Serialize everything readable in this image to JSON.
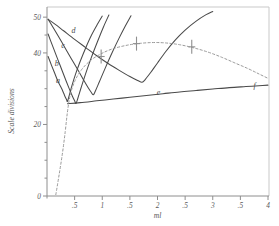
{
  "chart_data": {
    "type": "line",
    "title": "",
    "xlabel": "ml",
    "ylabel": "Scale divisions",
    "xlim": [
      0,
      4
    ],
    "ylim": [
      0,
      52
    ],
    "grid": false,
    "legend": "inline-curve-labels",
    "x_ticks": [
      {
        "value": 0,
        "label": ""
      },
      {
        "value": 0.5,
        "label": ".5"
      },
      {
        "value": 1.0,
        "label": "1"
      },
      {
        "value": 1.5,
        "label": ".5"
      },
      {
        "value": 2.0,
        "label": "2"
      },
      {
        "value": 2.5,
        "label": ".5"
      },
      {
        "value": 3.0,
        "label": "3"
      },
      {
        "value": 3.5,
        "label": ".5"
      },
      {
        "value": 4.0,
        "label": "4"
      }
    ],
    "y_ticks": [
      {
        "value": 0,
        "label": "0"
      },
      {
        "value": 5,
        "label": ""
      },
      {
        "value": 10,
        "label": ""
      },
      {
        "value": 15,
        "label": ""
      },
      {
        "value": 20,
        "label": "20"
      },
      {
        "value": 25,
        "label": ""
      },
      {
        "value": 30,
        "label": ""
      },
      {
        "value": 35,
        "label": ""
      },
      {
        "value": 40,
        "label": "40"
      },
      {
        "value": 45,
        "label": ""
      },
      {
        "value": 50,
        "label": "50"
      }
    ],
    "series": [
      {
        "name": "a",
        "label": "a",
        "style": "solid",
        "label_x": 0.2,
        "label_y": 31.5,
        "points": [
          [
            0.02,
            39.0
          ],
          [
            0.08,
            36.6
          ],
          [
            0.14,
            34.3
          ],
          [
            0.2,
            32.0
          ],
          [
            0.26,
            30.2
          ],
          [
            0.3,
            28.8
          ],
          [
            0.33,
            27.7
          ],
          [
            0.355,
            26.9
          ],
          [
            0.37,
            26.4
          ],
          [
            0.4,
            28.0
          ],
          [
            0.45,
            30.8
          ],
          [
            0.52,
            34.2
          ],
          [
            0.6,
            37.6
          ],
          [
            0.7,
            41.4
          ],
          [
            0.8,
            44.8
          ],
          [
            0.92,
            48.2
          ],
          [
            1.0,
            50.3
          ]
        ]
      },
      {
        "name": "b",
        "label": "b",
        "style": "solid",
        "label_x": 0.175,
        "label_y": 36.4,
        "points": [
          [
            0.02,
            45.3
          ],
          [
            0.08,
            42.8
          ],
          [
            0.16,
            39.6
          ],
          [
            0.24,
            36.4
          ],
          [
            0.32,
            33.2
          ],
          [
            0.4,
            30.1
          ],
          [
            0.46,
            27.9
          ],
          [
            0.5,
            26.6
          ],
          [
            0.525,
            25.9
          ],
          [
            0.56,
            27.4
          ],
          [
            0.62,
            30.4
          ],
          [
            0.7,
            34.2
          ],
          [
            0.8,
            38.6
          ],
          [
            0.92,
            43.4
          ],
          [
            1.02,
            47.2
          ],
          [
            1.12,
            50.6
          ]
        ]
      },
      {
        "name": "c",
        "label": "c",
        "style": "solid",
        "label_x": 0.29,
        "label_y": 41.3,
        "points": [
          [
            0.02,
            49.4
          ],
          [
            0.1,
            47.4
          ],
          [
            0.2,
            44.8
          ],
          [
            0.32,
            41.6
          ],
          [
            0.44,
            38.4
          ],
          [
            0.56,
            35.2
          ],
          [
            0.66,
            32.5
          ],
          [
            0.74,
            30.4
          ],
          [
            0.8,
            29.0
          ],
          [
            0.84,
            28.3
          ],
          [
            0.88,
            29.5
          ],
          [
            0.95,
            32.0
          ],
          [
            1.05,
            35.6
          ],
          [
            1.18,
            40.1
          ],
          [
            1.3,
            44.0
          ],
          [
            1.42,
            47.6
          ],
          [
            1.52,
            50.4
          ]
        ]
      },
      {
        "name": "d",
        "label": "d",
        "style": "solid",
        "label_x": 0.48,
        "label_y": 45.6,
        "points": [
          [
            0.02,
            49.4
          ],
          [
            0.15,
            48.0
          ],
          [
            0.3,
            46.2
          ],
          [
            0.5,
            43.8
          ],
          [
            0.7,
            41.5
          ],
          [
            0.9,
            39.2
          ],
          [
            1.1,
            37.1
          ],
          [
            1.3,
            35.2
          ],
          [
            1.5,
            33.4
          ],
          [
            1.64,
            32.3
          ],
          [
            1.72,
            31.8
          ],
          [
            1.78,
            32.6
          ],
          [
            1.88,
            34.6
          ],
          [
            2.0,
            37.2
          ],
          [
            2.15,
            40.4
          ],
          [
            2.32,
            43.6
          ],
          [
            2.5,
            46.4
          ],
          [
            2.7,
            48.9
          ],
          [
            2.88,
            50.7
          ],
          [
            3.0,
            51.6
          ]
        ]
      },
      {
        "name": "e",
        "label": "e",
        "style": "solid",
        "label_x": 2.02,
        "label_y": 28.3,
        "points": [
          [
            0.37,
            25.8
          ],
          [
            0.6,
            26.1
          ],
          [
            0.9,
            26.6
          ],
          [
            1.2,
            27.1
          ],
          [
            1.5,
            27.6
          ],
          [
            1.8,
            28.1
          ],
          [
            2.1,
            28.6
          ],
          [
            2.4,
            29.1
          ],
          [
            2.7,
            29.5
          ],
          [
            3.0,
            29.9
          ],
          [
            3.3,
            30.3
          ],
          [
            3.6,
            30.6
          ],
          [
            3.9,
            30.9
          ],
          [
            4.0,
            31.0
          ]
        ]
      },
      {
        "name": "f",
        "label": "f",
        "style": "dashed",
        "label_x": 3.76,
        "label_y": 30.2,
        "points": [
          [
            0.16,
            0.4
          ],
          [
            0.22,
            6.0
          ],
          [
            0.28,
            12.0
          ],
          [
            0.33,
            18.0
          ],
          [
            0.37,
            23.5
          ],
          [
            0.42,
            28.2
          ],
          [
            0.5,
            32.0
          ],
          [
            0.62,
            35.2
          ],
          [
            0.78,
            37.8
          ],
          [
            0.96,
            39.6
          ],
          [
            1.16,
            41.0
          ],
          [
            1.4,
            42.0
          ],
          [
            1.64,
            42.6
          ],
          [
            1.9,
            42.9
          ],
          [
            2.14,
            42.8
          ],
          [
            2.4,
            42.3
          ],
          [
            2.66,
            41.4
          ],
          [
            2.92,
            40.2
          ],
          [
            3.16,
            38.8
          ],
          [
            3.4,
            37.2
          ],
          [
            3.64,
            35.6
          ],
          [
            3.84,
            34.1
          ],
          [
            4.0,
            32.9
          ]
        ]
      }
    ],
    "markers": [
      {
        "x": 0.98,
        "y": 39.0,
        "label": ""
      },
      {
        "x": 1.62,
        "y": 42.6,
        "label": ""
      },
      {
        "x": 2.62,
        "y": 41.7,
        "label": ""
      }
    ]
  },
  "annotations": {
    "y_axis_title": "Scale divisions",
    "x_axis_title": "ml"
  }
}
